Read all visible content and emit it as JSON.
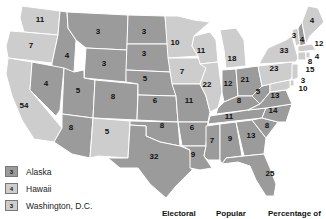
{
  "colors": {
    "party_a": "#9b9b9b",
    "party_b": "#cdcdcd",
    "border": "#ffffff"
  },
  "states": [
    {
      "abbr": "WA",
      "votes": "11",
      "party": "b"
    },
    {
      "abbr": "OR",
      "votes": "7",
      "party": "b"
    },
    {
      "abbr": "CA",
      "votes": "54",
      "party": "b"
    },
    {
      "abbr": "ID",
      "votes": "4",
      "party": "a"
    },
    {
      "abbr": "NV",
      "votes": "4",
      "party": "a"
    },
    {
      "abbr": "MT",
      "votes": "3",
      "party": "a"
    },
    {
      "abbr": "WY",
      "votes": "3",
      "party": "a"
    },
    {
      "abbr": "UT",
      "votes": "5",
      "party": "a"
    },
    {
      "abbr": "AZ",
      "votes": "8",
      "party": "a"
    },
    {
      "abbr": "CO",
      "votes": "8",
      "party": "a"
    },
    {
      "abbr": "NM",
      "votes": "5",
      "party": "b"
    },
    {
      "abbr": "ND",
      "votes": "3",
      "party": "a"
    },
    {
      "abbr": "SD",
      "votes": "3",
      "party": "a"
    },
    {
      "abbr": "NE",
      "votes": "5",
      "party": "a"
    },
    {
      "abbr": "KS",
      "votes": "6",
      "party": "a"
    },
    {
      "abbr": "OK",
      "votes": "8",
      "party": "a"
    },
    {
      "abbr": "TX",
      "votes": "32",
      "party": "a"
    },
    {
      "abbr": "MN",
      "votes": "10",
      "party": "b"
    },
    {
      "abbr": "IA",
      "votes": "7",
      "party": "b"
    },
    {
      "abbr": "MO",
      "votes": "11",
      "party": "a"
    },
    {
      "abbr": "AR",
      "votes": "6",
      "party": "a"
    },
    {
      "abbr": "LA",
      "votes": "9",
      "party": "a"
    },
    {
      "abbr": "WI",
      "votes": "11",
      "party": "b"
    },
    {
      "abbr": "IL",
      "votes": "22",
      "party": "b"
    },
    {
      "abbr": "MI",
      "votes": "18",
      "party": "b"
    },
    {
      "abbr": "IN",
      "votes": "12",
      "party": "a"
    },
    {
      "abbr": "OH",
      "votes": "21",
      "party": "a"
    },
    {
      "abbr": "KY",
      "votes": "8",
      "party": "a"
    },
    {
      "abbr": "TN",
      "votes": "11",
      "party": "a"
    },
    {
      "abbr": "MS",
      "votes": "7",
      "party": "a"
    },
    {
      "abbr": "AL",
      "votes": "9",
      "party": "a"
    },
    {
      "abbr": "GA",
      "votes": "13",
      "party": "a"
    },
    {
      "abbr": "FL",
      "votes": "25",
      "party": "a"
    },
    {
      "abbr": "SC",
      "votes": "8",
      "party": "a"
    },
    {
      "abbr": "NC",
      "votes": "14",
      "party": "a"
    },
    {
      "abbr": "VA",
      "votes": "13",
      "party": "a"
    },
    {
      "abbr": "WV",
      "votes": "5",
      "party": "a"
    },
    {
      "abbr": "PA",
      "votes": "23",
      "party": "b"
    },
    {
      "abbr": "NY",
      "votes": "33",
      "party": "b"
    },
    {
      "abbr": "VT",
      "votes": "3",
      "party": "b"
    },
    {
      "abbr": "NH",
      "votes": "4",
      "party": "a"
    },
    {
      "abbr": "ME",
      "votes": "4",
      "party": "b"
    },
    {
      "abbr": "MA",
      "votes": "12",
      "party": "b"
    },
    {
      "abbr": "RI",
      "votes": "4",
      "party": "b"
    },
    {
      "abbr": "CT",
      "votes": "8",
      "party": "b"
    },
    {
      "abbr": "NJ",
      "votes": "15",
      "party": "b"
    },
    {
      "abbr": "DE",
      "votes": "3",
      "party": "b"
    },
    {
      "abbr": "MD",
      "votes": "10",
      "party": "b"
    }
  ],
  "legend": [
    {
      "votes": "3",
      "label": "Alaska",
      "party": "a"
    },
    {
      "votes": "4",
      "label": "Hawaii",
      "party": "b"
    },
    {
      "votes": "3",
      "label": "Washington, D.C.",
      "party": "b"
    }
  ],
  "table_headers": [
    "Electoral",
    "Popular",
    "Percentage of"
  ]
}
